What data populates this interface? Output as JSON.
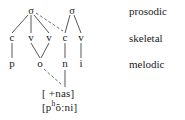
{
  "diagram": {
    "type": "autosegmental-phonology-tree",
    "prosodic_tier": {
      "nodes": [
        {
          "id": "sigma1",
          "label": "σ",
          "x": 31,
          "y": 11
        },
        {
          "id": "sigma2",
          "label": "σ",
          "x": 72,
          "y": 11
        }
      ]
    },
    "skeletal_tier": {
      "nodes": [
        {
          "id": "c1",
          "label": "c",
          "x": 12,
          "y": 38
        },
        {
          "id": "v1",
          "label": "v",
          "x": 31,
          "y": 38
        },
        {
          "id": "v2",
          "label": "v",
          "x": 49,
          "y": 38
        },
        {
          "id": "c2",
          "label": "c",
          "x": 65,
          "y": 38
        },
        {
          "id": "v3",
          "label": "v",
          "x": 81,
          "y": 38
        }
      ]
    },
    "melodic_tier": {
      "nodes": [
        {
          "id": "p",
          "label": "p",
          "x": 12,
          "y": 64
        },
        {
          "id": "o",
          "label": "o",
          "x": 40,
          "y": 64
        },
        {
          "id": "n",
          "label": "n",
          "x": 65,
          "y": 64
        },
        {
          "id": "i",
          "label": "i",
          "x": 81,
          "y": 64
        }
      ]
    },
    "feature_row": {
      "label": "[ +nas]",
      "x": 64,
      "y": 93
    },
    "transcription_row": {
      "label_parts": {
        "open_bracket": "[p",
        "superscript": "h",
        "rest": "õːni]"
      },
      "full_text": "[pʰõːni]",
      "x": 64,
      "y": 107
    },
    "tier_labels": [
      {
        "id": "prosodic",
        "label": "prosodic",
        "x": 129,
        "y": 11
      },
      {
        "id": "skeletal",
        "label": "skeletal",
        "x": 129,
        "y": 38
      },
      {
        "id": "melodic",
        "label": "melodic",
        "x": 129,
        "y": 64
      }
    ],
    "association_lines": {
      "solid_color": "#2b2b2b",
      "dashed_color": "#4a4a4a",
      "solid": [
        {
          "from": "sigma1",
          "to": "c1",
          "x1": 28,
          "y1": 15,
          "x2": 12,
          "y2": 33
        },
        {
          "from": "sigma1",
          "to": "v1",
          "x1": 31,
          "y1": 15,
          "x2": 31,
          "y2": 33
        },
        {
          "from": "sigma1",
          "to": "v2",
          "x1": 34,
          "y1": 15,
          "x2": 49,
          "y2": 33
        },
        {
          "from": "sigma2",
          "to": "c2",
          "x1": 70,
          "y1": 15,
          "x2": 65,
          "y2": 33
        },
        {
          "from": "sigma2",
          "to": "v3",
          "x1": 74,
          "y1": 15,
          "x2": 81,
          "y2": 33
        },
        {
          "from": "c1",
          "to": "p",
          "x1": 12,
          "y1": 43,
          "x2": 12,
          "y2": 58
        },
        {
          "from": "v1",
          "to": "o",
          "x1": 31,
          "y1": 43,
          "x2": 40,
          "y2": 58
        },
        {
          "from": "v2",
          "to": "o",
          "x1": 49,
          "y1": 43,
          "x2": 41,
          "y2": 58
        },
        {
          "from": "c2",
          "to": "n",
          "x1": 65,
          "y1": 43,
          "x2": 65,
          "y2": 58
        },
        {
          "from": "v3",
          "to": "i",
          "x1": 81,
          "y1": 43,
          "x2": 81,
          "y2": 58
        },
        {
          "from": "n",
          "to": "feature",
          "x1": 65,
          "y1": 70,
          "x2": 65,
          "y2": 87
        }
      ],
      "dashed": [
        {
          "from": "sigma1",
          "to": "c2",
          "x1": 36,
          "y1": 13,
          "x2": 63,
          "y2": 31
        },
        {
          "from": "o",
          "to": "feature",
          "x1": 44,
          "y1": 69,
          "x2": 62,
          "y2": 85
        }
      ]
    }
  }
}
